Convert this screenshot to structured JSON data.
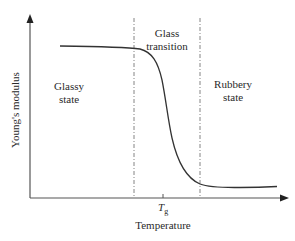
{
  "diagram": {
    "x_axis": {
      "label": "Temperature",
      "tick_label_main": "T",
      "tick_label_sub": "g"
    },
    "y_axis": {
      "label": "Young's modulus"
    },
    "regions": [
      {
        "id": "glassy",
        "line1": "Glassy",
        "line2": "state"
      },
      {
        "id": "transition",
        "line1": "Glass",
        "line2": "transition"
      },
      {
        "id": "rubbery",
        "line1": "Rubbery",
        "line2": "state"
      }
    ],
    "colors": {
      "curve": "#333333",
      "axes": "#444444",
      "dashed": "#666666",
      "text": "#2a2a2a"
    }
  }
}
